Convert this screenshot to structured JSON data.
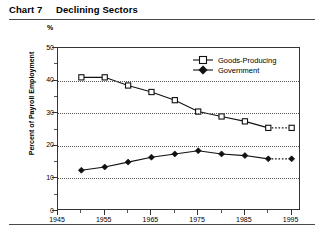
{
  "header": {
    "chart_number": "Chart 7",
    "title": "Declining Sectors"
  },
  "chart_data": {
    "type": "line",
    "title": "Declining Sectors",
    "xlabel": "Year",
    "ylabel": "Percent of Payroll Employment",
    "y_unit_symbol": "%",
    "xlim": [
      1945,
      1997
    ],
    "ylim": [
      0,
      50
    ],
    "ytick_values": [
      0,
      10,
      20,
      30,
      40,
      50
    ],
    "ytick_labels": [
      "0",
      "10",
      "20",
      "30",
      "40",
      "50"
    ],
    "y_minor_ticks": [
      5,
      15,
      25,
      35,
      45
    ],
    "xtick_values": [
      1945,
      1955,
      1965,
      1975,
      1985,
      1995
    ],
    "xtick_labels": [
      "1945",
      "1955",
      "1965",
      "1975",
      "1985",
      "1995"
    ],
    "x_minor_ticks": [
      1950,
      1960,
      1970,
      1980,
      1990
    ],
    "grid": "horizontal-dotted",
    "legend_position": "top-right",
    "x": [
      1950,
      1955,
      1960,
      1965,
      1970,
      1975,
      1980,
      1985,
      1990,
      1995
    ],
    "series": [
      {
        "name": "Goods-Producing",
        "marker": "open-square",
        "values": [
          41.0,
          41.0,
          38.5,
          36.5,
          34.0,
          30.5,
          29.0,
          27.5,
          25.5,
          25.5
        ],
        "projection_from": 1990
      },
      {
        "name": "Government",
        "marker": "filled-diamond",
        "values": [
          12.5,
          13.5,
          15.0,
          16.5,
          17.5,
          18.5,
          17.5,
          17.0,
          16.0,
          16.0
        ],
        "projection_from": 1990
      }
    ]
  },
  "legend": {
    "items": [
      {
        "label": "Goods-Producing"
      },
      {
        "label": "Government"
      }
    ]
  },
  "colors": {
    "ink": "#000000",
    "axis": "#333333",
    "grid": "#555555",
    "rule": "#4a4a4a"
  }
}
